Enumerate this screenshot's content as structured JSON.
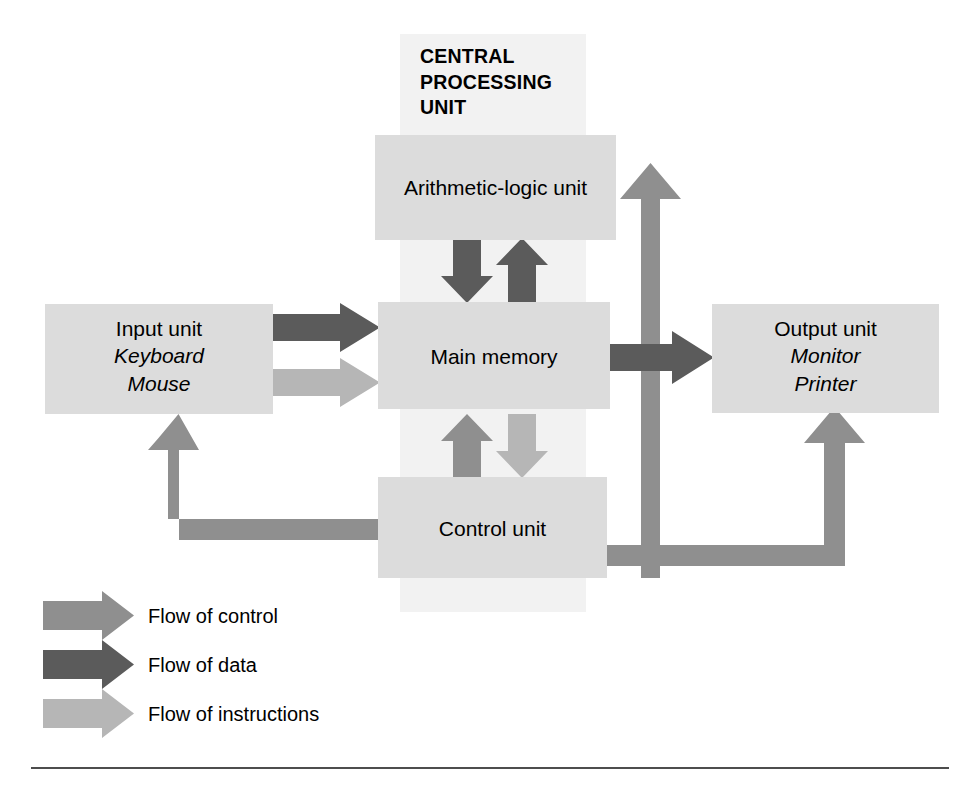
{
  "figure": {
    "cpu_band": {
      "title_lines": [
        "CENTRAL",
        "PROCESSING",
        "UNIT"
      ],
      "fill": "#f2f2f2"
    },
    "colors": {
      "box_fill": "#dcdcdc",
      "flow_control": "#8f8f8f",
      "flow_data": "#5b5b5b",
      "flow_instructions": "#b6b6b6",
      "rule": "#4d4d4d",
      "text": "#000000"
    },
    "boxes": [
      {
        "id": "alu",
        "name": "arithmetic-logic-unit",
        "lines": [
          {
            "text": "Arithmetic-logic unit",
            "italic": false
          }
        ]
      },
      {
        "id": "main_memory",
        "name": "main-memory",
        "lines": [
          {
            "text": "Main memory",
            "italic": false
          }
        ]
      },
      {
        "id": "control_unit",
        "name": "control-unit",
        "lines": [
          {
            "text": "Control unit",
            "italic": false
          }
        ]
      },
      {
        "id": "input_unit",
        "name": "input-unit",
        "lines": [
          {
            "text": "Input unit",
            "italic": false
          },
          {
            "text": "Keyboard",
            "italic": true
          },
          {
            "text": "Mouse",
            "italic": true
          }
        ]
      },
      {
        "id": "output_unit",
        "name": "output-unit",
        "lines": [
          {
            "text": "Output unit",
            "italic": false
          },
          {
            "text": "Monitor",
            "italic": true
          },
          {
            "text": "Printer",
            "italic": true
          }
        ]
      }
    ],
    "legend": {
      "items": [
        {
          "id": "control",
          "label": "Flow of control",
          "color": "#8f8f8f"
        },
        {
          "id": "data",
          "label": "Flow of data",
          "color": "#5b5b5b"
        },
        {
          "id": "instructions",
          "label": "Flow of instructions",
          "color": "#b6b6b6"
        }
      ]
    },
    "flows": [
      {
        "from": "input_unit",
        "to": "main_memory",
        "kind": "data"
      },
      {
        "from": "input_unit",
        "to": "main_memory",
        "kind": "instructions"
      },
      {
        "from": "main_memory",
        "to": "output_unit",
        "kind": "data"
      },
      {
        "from": "main_memory",
        "to": "alu",
        "kind": "data"
      },
      {
        "from": "alu",
        "to": "main_memory",
        "kind": "data"
      },
      {
        "from": "main_memory",
        "to": "control_unit",
        "kind": "control"
      },
      {
        "from": "control_unit",
        "to": "main_memory",
        "kind": "instructions"
      },
      {
        "from": "control_unit",
        "to": "alu",
        "kind": "control"
      },
      {
        "from": "control_unit",
        "to": "input_unit",
        "kind": "control"
      },
      {
        "from": "control_unit",
        "to": "output_unit",
        "kind": "control"
      }
    ]
  }
}
